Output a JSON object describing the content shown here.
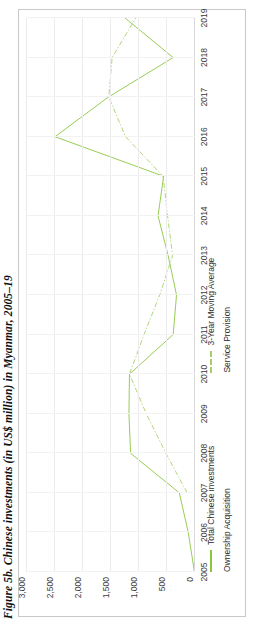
{
  "figure": {
    "title": "Figure 5b. Chinese investments (in US$ million) in Myanmar, 2005–19"
  },
  "colors": {
    "total_line": "#8cc63f",
    "moving_average": "#a8cf6e",
    "ownership_acquisition": "#8cc63f",
    "service_provision": "#8cc63f",
    "gridline": "#ececec",
    "panel_border": "#c9c9c9",
    "text": "#2e2e2e"
  },
  "legend": {
    "position": "bottom",
    "items": [
      {
        "label": "Ownership Acquisition",
        "style": "none"
      },
      {
        "label": "Service Provision",
        "style": "none"
      },
      {
        "label": "Total Chinese investments",
        "style": "solid"
      },
      {
        "label": "3-Year Moving Average",
        "style": "dash-dot"
      }
    ]
  },
  "chart_data": {
    "type": "line",
    "title": "Figure 5b. Chinese investments (in US$ million) in Myanmar, 2005–19",
    "xlabel": "",
    "ylabel": "",
    "grid": true,
    "ylim": [
      0,
      3000
    ],
    "yticks": [
      0,
      500,
      1000,
      1500,
      2000,
      2500,
      3000
    ],
    "ytick_labels": [
      "0",
      "500",
      "1,000",
      "1,500",
      "2,000",
      "2,500",
      "3,000"
    ],
    "x": [
      2005,
      2006,
      2007,
      2008,
      2009,
      2010,
      2011,
      2012,
      2013,
      2014,
      2015,
      2016,
      2017,
      2018,
      2019
    ],
    "xtick_labels": [
      "2005",
      "2006",
      "2007",
      "2008",
      "2009",
      "2010",
      "2011",
      "2012",
      "2013",
      "2014",
      "2015",
      "2016",
      "2017",
      "2018",
      "2019"
    ],
    "series": [
      {
        "name": "Total Chinese investments",
        "style": "solid",
        "color": "#8cc63f",
        "values": [
          10,
          120,
          280,
          1150,
          1180,
          1170,
          390,
          330,
          480,
          660,
          560,
          2500,
          1550,
          390,
          1250
        ]
      },
      {
        "name": "3-Year Moving Average",
        "style": "dash-dot",
        "color": "#a8cf6e",
        "values": [
          null,
          null,
          140,
          520,
          870,
          1170,
          910,
          630,
          400,
          490,
          570,
          1240,
          1540,
          1480,
          1060
        ]
      }
    ]
  }
}
